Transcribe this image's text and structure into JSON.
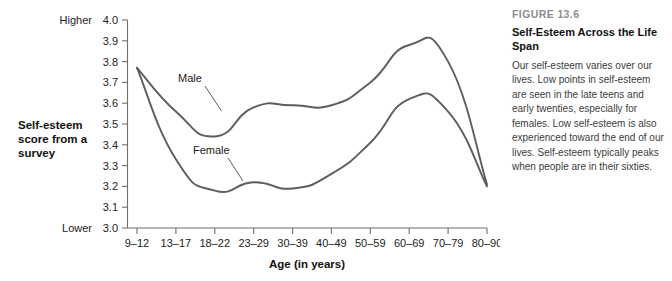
{
  "chart_data": {
    "type": "line",
    "title": "Self-Esteem Across the Life Span",
    "xlabel": "Age (in years)",
    "ylabel": "Self-esteem score from a survey",
    "categories": [
      "9–12",
      "13–17",
      "18–22",
      "23–29",
      "30–39",
      "40–49",
      "50–59",
      "60–69",
      "70–79",
      "80–90"
    ],
    "ylim": [
      3.0,
      4.0
    ],
    "ytick_labels": [
      "4.0",
      "3.9",
      "3.8",
      "3.7",
      "3.6",
      "3.5",
      "3.4",
      "3.3",
      "3.2",
      "3.1",
      "3.0"
    ],
    "ytick_values": [
      4.0,
      3.9,
      3.8,
      3.7,
      3.6,
      3.5,
      3.4,
      3.3,
      3.2,
      3.1,
      3.0
    ],
    "y_axis_high_anchor": "Higher",
    "y_axis_low_anchor": "Lower",
    "grid": false,
    "legend_position": "inline-annotations",
    "series": [
      {
        "name": "Male",
        "values": [
          3.77,
          3.56,
          3.44,
          3.58,
          3.59,
          3.59,
          3.7,
          3.88,
          3.8,
          3.21
        ]
      },
      {
        "name": "Female",
        "values": [
          3.77,
          3.33,
          3.18,
          3.22,
          3.19,
          3.26,
          3.41,
          3.62,
          3.56,
          3.2
        ]
      }
    ],
    "annotations": [
      {
        "text": "Male",
        "points_to_series": "Male",
        "points_to_category": "18–22"
      },
      {
        "text": "Female",
        "points_to_series": "Female",
        "points_to_category": "23–29"
      }
    ]
  },
  "caption": {
    "eyebrow": "FIGURE 13.6",
    "title": "Self-Esteem Across the Life Span",
    "body": "Our self-esteem varies over our lives. Low points in self-esteem are seen in the late teens and early twenties, especially for females. Low self-esteem is also experienced toward the end of our lives. Self-esteem typically peaks when people are in their sixties."
  }
}
